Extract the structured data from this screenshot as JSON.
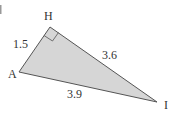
{
  "diagram": {
    "type": "right-triangle",
    "vertices": {
      "H": {
        "label": "H",
        "x": 50,
        "y": 27
      },
      "A": {
        "label": "A",
        "x": 19,
        "y": 72
      },
      "I": {
        "label": "I",
        "x": 157,
        "y": 102
      }
    },
    "right_angle_at": "H",
    "sides": {
      "AH": {
        "label": "1.5"
      },
      "HI": {
        "label": "3.6"
      },
      "AI": {
        "label": "3.9"
      }
    },
    "colors": {
      "fill": "#d6d6d6",
      "stroke": "#555555",
      "text": "#333333"
    }
  }
}
